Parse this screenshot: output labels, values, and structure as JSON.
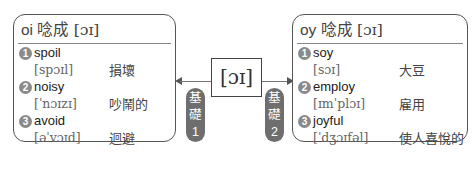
{
  "left_card": {
    "title_prefix": "oi 唸成 ",
    "title_ipa": "[ɔɪ]",
    "entries": [
      {
        "num": "1",
        "word": "spoil",
        "pron": "[spɔɪl]",
        "meaning": "損壞"
      },
      {
        "num": "2",
        "word": "noisy",
        "pron": "[ˈnɔɪzɪ]",
        "meaning": "吵鬧的"
      },
      {
        "num": "3",
        "word": "avoid",
        "pron": "[əˈvɔɪd]",
        "meaning": "迴避"
      }
    ]
  },
  "right_card": {
    "title_prefix": "oy 唸成 ",
    "title_ipa": "[ɔɪ]",
    "entries": [
      {
        "num": "1",
        "word": "soy",
        "pron": "[sɔɪ]",
        "meaning": "大豆"
      },
      {
        "num": "2",
        "word": "employ",
        "pron": "[ɪmˈplɔɪ]",
        "meaning": "雇用"
      },
      {
        "num": "3",
        "word": "joyful",
        "pron": "[ˈdʒɔɪfəl]",
        "meaning": "使人喜悅的"
      }
    ]
  },
  "center": {
    "ipa": "[ɔɪ]"
  },
  "badges": [
    {
      "line1": "基",
      "line2": "礎",
      "line3": "1"
    },
    {
      "line1": "基",
      "line2": "礎",
      "line3": "2"
    }
  ]
}
